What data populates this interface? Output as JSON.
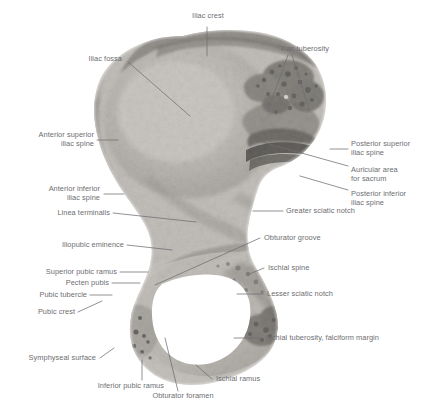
{
  "figure": {
    "type": "anatomical-photograph",
    "background_color": "#ffffff",
    "label_color": "#6d6e71",
    "leader_color": "#6d6e71",
    "bone_tone_light": "#e8e6e2",
    "bone_tone_mid": "#c3c0bb",
    "bone_tone_dark": "#8a8781",
    "bone_tone_darkest": "#4a4845",
    "foramen_color": "#ffffff"
  },
  "labels": [
    {
      "id": "iliac-crest",
      "text": "Iliac crest",
      "align": "center"
    },
    {
      "id": "iliac-fossa",
      "text": "Iliac fossa",
      "align": "right"
    },
    {
      "id": "iliac-tuberosity",
      "text": "Iliac tuberosity",
      "align": "left"
    },
    {
      "id": "anterior-superior-iliac-spine",
      "text": "Anterior superior\niliac spine",
      "align": "right"
    },
    {
      "id": "posterior-superior-iliac-spine",
      "text": "Posterior superior\niliac spine",
      "align": "left"
    },
    {
      "id": "auricular-area-for-sacrum",
      "text": "Auricular area\nfor sacrum",
      "align": "left"
    },
    {
      "id": "anterior-inferior-iliac-spine",
      "text": "Anterior inferior\niliac spine",
      "align": "right"
    },
    {
      "id": "posterior-inferior-iliac-spine",
      "text": "Posterior inferior\niliac spine",
      "align": "left"
    },
    {
      "id": "linea-terminalis",
      "text": "Linea terminalis",
      "align": "right"
    },
    {
      "id": "greater-sciatic-notch",
      "text": "Greater sciatic notch",
      "align": "left"
    },
    {
      "id": "iliopubic-eminence",
      "text": "Iliopubic eminence",
      "align": "right"
    },
    {
      "id": "obturator-groove",
      "text": "Obturator groove",
      "align": "left"
    },
    {
      "id": "superior-pubic-ramus",
      "text": "Superior pubic ramus",
      "align": "right"
    },
    {
      "id": "ischial-spine",
      "text": "Ischial spine",
      "align": "left"
    },
    {
      "id": "pecten-pubis",
      "text": "Pecten pubis",
      "align": "right"
    },
    {
      "id": "pubic-tubercle",
      "text": "Pubic tubercle",
      "align": "right"
    },
    {
      "id": "lesser-sciatic-notch",
      "text": "Lesser sciatic notch",
      "align": "left"
    },
    {
      "id": "pubic-crest",
      "text": "Pubic crest",
      "align": "right"
    },
    {
      "id": "ischial-tuberosity-falciform-margin",
      "text": "Ischial tuberosity, falciform margin",
      "align": "left"
    },
    {
      "id": "symphyseal-surface",
      "text": "Symphyseal surface",
      "align": "right"
    },
    {
      "id": "inferior-pubic-ramus",
      "text": "Inferior pubic ramus",
      "align": "right"
    },
    {
      "id": "ischial-ramus",
      "text": "Ischial ramus",
      "align": "left"
    },
    {
      "id": "obturator-foramen",
      "text": "Obturator foramen",
      "align": "center"
    }
  ]
}
